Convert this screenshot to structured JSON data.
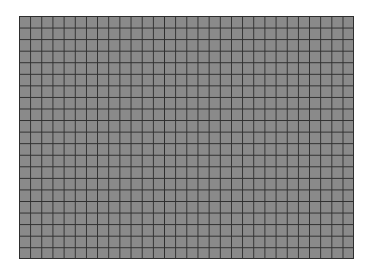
{
  "grid": {
    "columns": 30,
    "rows": 21,
    "cell_color": "#8a8a8a",
    "line_color": "#2e2e2e",
    "background_color": "#ffffff"
  }
}
